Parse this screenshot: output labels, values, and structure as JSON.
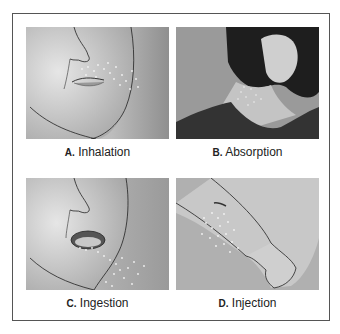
{
  "figure": {
    "panels": [
      {
        "id": "A",
        "letter": "A.",
        "label": "Inhalation",
        "subject": "face-nose-mouth-with-particles-near-nostrils"
      },
      {
        "id": "B",
        "letter": "B.",
        "label": "Absorption",
        "subject": "woman-neck-skin-with-particles"
      },
      {
        "id": "C",
        "letter": "C.",
        "label": "Ingestion",
        "subject": "open-mouth-with-particles-entering"
      },
      {
        "id": "D",
        "letter": "D.",
        "label": "Injection",
        "subject": "forearm-with-puncture-and-particles"
      }
    ],
    "colors": {
      "border": "#555555",
      "background": "#ffffff",
      "panel_gray": "#a8a8a8",
      "skin_light": "#d6d6d6",
      "hair_dark": "#1e1e1e",
      "particles": "#f4f4f4"
    }
  }
}
